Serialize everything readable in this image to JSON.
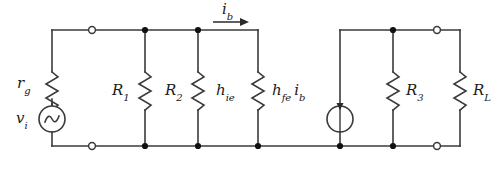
{
  "figure": {
    "type": "circuit-schematic",
    "background_color": "#ffffff",
    "line_color": "#3a3a3a",
    "text_color": "#1a1a1a"
  },
  "labels": {
    "source_resistance": {
      "main": "r",
      "sub": "g",
      "name": "rg-label"
    },
    "source_voltage": {
      "main": "v",
      "sub": "i",
      "name": "vi-label"
    },
    "bias_resistor_1": {
      "main": "R",
      "sub": "1",
      "name": "r1-label"
    },
    "bias_resistor_2": {
      "main": "R",
      "sub": "2",
      "name": "r2-label"
    },
    "input_impedance": {
      "main": "h",
      "sub": "ie",
      "name": "hie-label"
    },
    "controlled_source": {
      "main": "h",
      "sub": "fe",
      "main2": "i",
      "sub2": "b",
      "name": "hfe-ib-label"
    },
    "collector_resistor": {
      "main": "R",
      "sub": "3",
      "name": "r3-label"
    },
    "load_resistor": {
      "main": "R",
      "sub": "L",
      "name": "rl-label"
    },
    "base_current": {
      "main": "i",
      "sub": "b",
      "name": "ib-label"
    }
  },
  "components": [
    {
      "id": "rg",
      "kind": "resistor",
      "label": "r_g",
      "orientation": "vertical",
      "x": 52
    },
    {
      "id": "vi",
      "kind": "ac-voltage-source",
      "label": "v_i",
      "x": 52
    },
    {
      "id": "r1",
      "kind": "resistor",
      "label": "R_1",
      "orientation": "vertical",
      "x": 145
    },
    {
      "id": "r2",
      "kind": "resistor",
      "label": "R_2",
      "orientation": "vertical",
      "x": 198
    },
    {
      "id": "hie",
      "kind": "resistor",
      "label": "h_ie",
      "orientation": "vertical",
      "x": 255
    },
    {
      "id": "hfeib",
      "kind": "current-source",
      "label": "h_fe i_b",
      "direction": "down",
      "x": 340
    },
    {
      "id": "r3",
      "kind": "resistor",
      "label": "R_3",
      "orientation": "vertical",
      "x": 393
    },
    {
      "id": "rl",
      "kind": "resistor",
      "label": "R_L",
      "orientation": "vertical",
      "x": 460
    }
  ],
  "terminals": [
    {
      "id": "input-top",
      "type": "open",
      "x": 92,
      "y": 30
    },
    {
      "id": "input-bottom",
      "type": "open",
      "x": 92,
      "y": 146
    },
    {
      "id": "output-top",
      "type": "open",
      "x": 437,
      "y": 30
    },
    {
      "id": "output-bottom",
      "type": "open",
      "x": 437,
      "y": 146
    }
  ],
  "junctions": [
    {
      "x": 145,
      "y": 30
    },
    {
      "x": 198,
      "y": 30
    },
    {
      "x": 393,
      "y": 30
    },
    {
      "x": 145,
      "y": 146
    },
    {
      "x": 198,
      "y": 146
    },
    {
      "x": 255,
      "y": 146
    },
    {
      "x": 340,
      "y": 146
    },
    {
      "x": 393,
      "y": 146
    }
  ],
  "current_arrow": {
    "label": "i_b",
    "direction": "right",
    "x_start": 213,
    "x_end": 248,
    "y": 22
  }
}
